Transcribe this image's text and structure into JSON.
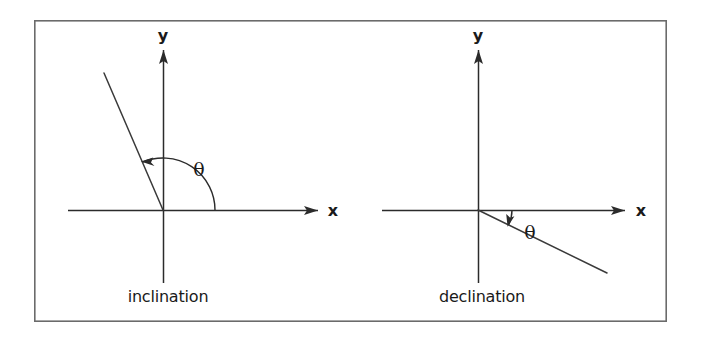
{
  "figure": {
    "background_color": "#ffffff",
    "frame": {
      "name": "outer-frame",
      "x": 34,
      "y": 20,
      "width": 633,
      "height": 302,
      "stroke_color": "#6b6b6b",
      "fill_color": "#ffffff"
    },
    "line_color": "#2b2b2b",
    "panels": [
      {
        "id": "inclination",
        "caption": "inclination",
        "caption_x": 168,
        "caption_y": 302,
        "origin": {
          "x": 163,
          "y": 210
        },
        "x_axis": {
          "label": "x",
          "label_x": 333,
          "label_y": 216,
          "start_x": 68,
          "end_x": 318,
          "y": 210
        },
        "y_axis": {
          "label": "y",
          "label_x": 163,
          "label_y": 41,
          "top_y": 50,
          "bottom_y": 283,
          "x": 163
        },
        "ray": {
          "from_x": 163,
          "from_y": 210,
          "to_x": 104,
          "to_y": 73
        },
        "angle": {
          "symbol": "θ",
          "symbol_x": 199,
          "symbol_y": 176,
          "radius": 52,
          "start_deg": 0,
          "end_deg": 113,
          "direction": "counterclockwise",
          "arrowhead_at": "ray"
        }
      },
      {
        "id": "declination",
        "caption": "declination",
        "caption_x": 482,
        "caption_y": 302,
        "origin": {
          "x": 478,
          "y": 210
        },
        "x_axis": {
          "label": "x",
          "label_x": 641,
          "label_y": 216,
          "start_x": 382,
          "end_x": 625,
          "y": 210
        },
        "y_axis": {
          "label": "y",
          "label_x": 478,
          "label_y": 41,
          "top_y": 50,
          "bottom_y": 283,
          "x": 478
        },
        "ray": {
          "from_x": 478,
          "from_y": 210,
          "to_x": 607,
          "to_y": 273
        },
        "angle": {
          "symbol": "θ",
          "symbol_x": 530,
          "symbol_y": 239,
          "radius": 34,
          "start_deg": 0,
          "end_deg": -26,
          "direction": "clockwise",
          "arrowhead_at": "ray"
        }
      }
    ]
  }
}
